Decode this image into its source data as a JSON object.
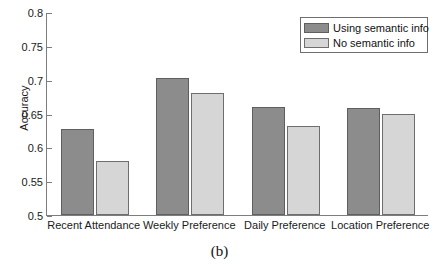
{
  "caption": "(b)",
  "legend": {
    "entries": [
      {
        "label": "Using semantic info",
        "color": "#8c8c8c",
        "swatch": "dark-swatch"
      },
      {
        "label": "No semantic info",
        "color": "#d6d6d6",
        "swatch": "light-swatch"
      }
    ]
  },
  "axes": {
    "ylabel": "Accuracy",
    "xlabel": "",
    "yticks": [
      "0.5",
      "0.55",
      "0.6",
      "0.65",
      "0.7",
      "0.75",
      "0.8"
    ]
  },
  "chart_data": {
    "type": "bar",
    "title": "",
    "subtitle": "",
    "xlabel": "",
    "ylabel": "Accuracy",
    "categories": [
      "Recent Attendance",
      "Weekly Preference",
      "Daily Preference",
      "Location Preference"
    ],
    "series": [
      {
        "name": "Using semantic info",
        "color": "#8c8c8c",
        "values": [
          0.627,
          0.703,
          0.66,
          0.658
        ]
      },
      {
        "name": "No semantic info",
        "color": "#d6d6d6",
        "values": [
          0.58,
          0.68,
          0.632,
          0.65
        ]
      }
    ],
    "ylim": [
      0.5,
      0.8
    ],
    "yticks": [
      0.5,
      0.55,
      0.6,
      0.65,
      0.7,
      0.75,
      0.8
    ],
    "ytick_labels": [
      "0.5",
      "0.55",
      "0.6",
      "0.65",
      "0.7",
      "0.75",
      "0.8"
    ],
    "grid": false,
    "legend_position": "top-right",
    "caption": "(b)"
  }
}
